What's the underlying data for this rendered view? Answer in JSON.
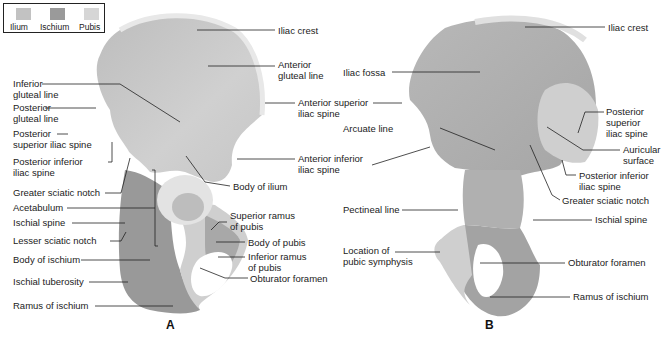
{
  "legend": {
    "items": [
      {
        "label": "Ilium",
        "color": "#c2c2c2"
      },
      {
        "label": "Ischium",
        "color": "#9a9a9a"
      },
      {
        "label": "Pubis",
        "color": "#d6d6d6"
      }
    ]
  },
  "panel_a": {
    "letter": "A",
    "labels": {
      "iliac_crest": "Iliac crest",
      "anterior_gluteal_line_1": "Anterior",
      "anterior_gluteal_line_2": "gluteal line",
      "inferior_gluteal_line_1": "Inferior",
      "inferior_gluteal_line_2": "gluteal line",
      "posterior_gluteal_line_1": "Posterior",
      "posterior_gluteal_line_2": "gluteal line",
      "posterior_superior_iliac_spine_1": "Posterior",
      "posterior_superior_iliac_spine_2": "superior iliac spine",
      "anterior_superior_iliac_spine_1": "Anterior superior",
      "anterior_superior_iliac_spine_2": "iliac spine",
      "posterior_inferior_iliac_spine_1": "Posterior inferior",
      "posterior_inferior_iliac_spine_2": "iliac spine",
      "anterior_inferior_iliac_spine_1": "Anterior inferior",
      "anterior_inferior_iliac_spine_2": "iliac spine",
      "greater_sciatic_notch": "Greater sciatic notch",
      "body_of_ilium": "Body of ilium",
      "acetabulum": "Acetabulum",
      "superior_ramus_of_pubis_1": "Superior ramus",
      "superior_ramus_of_pubis_2": "of pubis",
      "ischial_spine": "Ischial spine",
      "lesser_sciatic_notch": "Lesser sciatic notch",
      "body_of_pubis": "Body of pubis",
      "body_of_ischium": "Body of ischium",
      "inferior_ramus_of_pubis_1": "Inferior ramus",
      "inferior_ramus_of_pubis_2": "of pubis",
      "obturator_foramen": "Obturator foramen",
      "ischial_tuberosity": "Ischial tuberosity",
      "ramus_of_ischium": "Ramus of ischium"
    }
  },
  "panel_b": {
    "letter": "B",
    "labels": {
      "iliac_crest": "Iliac crest",
      "iliac_fossa": "Iliac fossa",
      "anterior_superior_iliac_spine_1": "Anterior superior",
      "anterior_superior_iliac_spine_2": "iliac spine",
      "posterior_superior_iliac_spine_1": "Posterior",
      "posterior_superior_iliac_spine_2": "superior",
      "posterior_superior_iliac_spine_3": "iliac spine",
      "arcuate_line": "Arcuate line",
      "auricular_surface_1": "Auricular",
      "auricular_surface_2": "surface",
      "anterior_inferior_iliac_spine_1": "Anterior inferior",
      "anterior_inferior_iliac_spine_2": "iliac spine",
      "posterior_inferior_iliac_spine_1": "Posterior inferior",
      "posterior_inferior_iliac_spine_2": "iliac spine",
      "greater_sciatic_notch": "Greater sciatic notch",
      "pectineal_line": "Pectineal line",
      "ischial_spine": "Ischial spine",
      "location_of_pubic_symphysis_1": "Location of",
      "location_of_pubic_symphysis_2": "pubic symphysis",
      "obturator_foramen": "Obturator foramen",
      "ramus_of_ischium": "Ramus of ischium"
    }
  }
}
